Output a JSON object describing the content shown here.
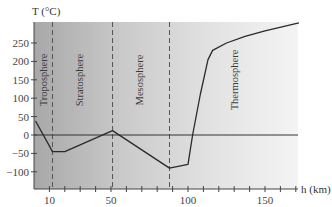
{
  "chart_data": {
    "type": "line",
    "title": "",
    "xlabel": "h (km)",
    "ylabel": "T (°C)",
    "xlim": [
      0,
      172
    ],
    "ylim": [
      -145,
      310
    ],
    "x_ticks": [
      10,
      50,
      100,
      150
    ],
    "x_minor_ticks": [
      10,
      20,
      30,
      40,
      50,
      60,
      70,
      80,
      90,
      100,
      110,
      120,
      130,
      140,
      150,
      160,
      170
    ],
    "y_ticks": [
      250,
      200,
      150,
      100,
      50,
      0,
      -50,
      -100
    ],
    "y_tick_labels": [
      "250",
      "200",
      "150",
      "100",
      "50",
      "0",
      "−50",
      "−100"
    ],
    "x_tick_labels": [
      "10",
      "50",
      "100",
      "150"
    ],
    "grid": false,
    "legend": null,
    "series": [
      {
        "name": "Temperature profile",
        "x": [
          1,
          12,
          20,
          51,
          88,
          100,
          103,
          108,
          113,
          116,
          125,
          137,
          150,
          172
        ],
        "values": [
          38,
          -45,
          -45,
          12,
          -90,
          -80,
          0,
          110,
          205,
          230,
          250,
          268,
          283,
          305
        ]
      }
    ],
    "boundaries_km": [
      12,
      51,
      88
    ],
    "layers": [
      {
        "name": "Troposphere",
        "label_h": 7
      },
      {
        "name": "Stratosphere",
        "label_h": 30
      },
      {
        "name": "Mesosphere",
        "label_h": 69
      },
      {
        "name": "Thermosphere",
        "label_h": 131
      }
    ],
    "background": {
      "type": "gradient",
      "from": "#a9a9a9",
      "to": "#f3f3f3"
    }
  },
  "labels": {
    "y_axis_title": "T (°C)",
    "x_axis_title": "h (km)"
  }
}
